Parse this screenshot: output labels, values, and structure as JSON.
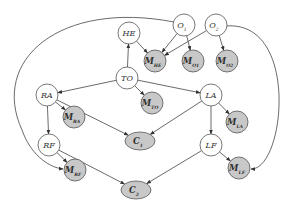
{
  "diagram": {
    "type": "bayesian-network",
    "nodes": [
      {
        "id": "HE",
        "label": "HE",
        "sub": "",
        "x": 129,
        "y": 33,
        "shape": "circle",
        "shaded": false
      },
      {
        "id": "O1",
        "label": "O",
        "sub": "1",
        "x": 184,
        "y": 25,
        "shape": "circle",
        "shaded": false
      },
      {
        "id": "O2",
        "label": "O",
        "sub": "2",
        "x": 216,
        "y": 25,
        "shape": "circle",
        "shaded": false
      },
      {
        "id": "MHE",
        "label": "M",
        "sub": "HE",
        "x": 155,
        "y": 61,
        "shape": "circle",
        "shaded": true
      },
      {
        "id": "MO1",
        "label": "M",
        "sub": "O1",
        "x": 193,
        "y": 61,
        "shape": "circle",
        "shaded": true
      },
      {
        "id": "MO2",
        "label": "M",
        "sub": "O2",
        "x": 227,
        "y": 61,
        "shape": "circle",
        "shaded": true
      },
      {
        "id": "TO",
        "label": "TO",
        "sub": "",
        "x": 127,
        "y": 78,
        "shape": "circle",
        "shaded": false
      },
      {
        "id": "RA",
        "label": "RA",
        "sub": "",
        "x": 47,
        "y": 95,
        "shape": "circle",
        "shaded": false
      },
      {
        "id": "MTO",
        "label": "M",
        "sub": "TO",
        "x": 152,
        "y": 103,
        "shape": "circle",
        "shaded": true
      },
      {
        "id": "LA",
        "label": "LA",
        "sub": "",
        "x": 211,
        "y": 95,
        "shape": "circle",
        "shaded": false
      },
      {
        "id": "MRA",
        "label": "M",
        "sub": "RA",
        "x": 74,
        "y": 117,
        "shape": "circle",
        "shaded": true
      },
      {
        "id": "MLA",
        "label": "M",
        "sub": "LA",
        "x": 237,
        "y": 122,
        "shape": "circle",
        "shaded": true
      },
      {
        "id": "C1",
        "label": "C",
        "sub": "1",
        "x": 140,
        "y": 141,
        "shape": "ellipse",
        "shaded": true
      },
      {
        "id": "RF",
        "label": "RF",
        "sub": "",
        "x": 49,
        "y": 145,
        "shape": "circle",
        "shaded": false
      },
      {
        "id": "LF",
        "label": "LF",
        "sub": "",
        "x": 211,
        "y": 145,
        "shape": "circle",
        "shaded": false
      },
      {
        "id": "MRF",
        "label": "M",
        "sub": "RF",
        "x": 75,
        "y": 170,
        "shape": "circle",
        "shaded": true
      },
      {
        "id": "MLF",
        "label": "M",
        "sub": "LF",
        "x": 239,
        "y": 168,
        "shape": "circle",
        "shaded": true
      },
      {
        "id": "C2",
        "label": "C",
        "sub": "2",
        "x": 136,
        "y": 190,
        "shape": "ellipse",
        "shaded": true
      }
    ],
    "edges": [
      {
        "from": "TO",
        "to": "HE"
      },
      {
        "from": "TO",
        "to": "RA"
      },
      {
        "from": "TO",
        "to": "LA"
      },
      {
        "from": "TO",
        "to": "MTO"
      },
      {
        "from": "HE",
        "to": "MHE"
      },
      {
        "from": "O1",
        "to": "MHE"
      },
      {
        "from": "O2",
        "to": "MHE"
      },
      {
        "from": "O1",
        "to": "MO1"
      },
      {
        "from": "O2",
        "to": "MO2"
      },
      {
        "from": "RA",
        "to": "MRA"
      },
      {
        "from": "RA",
        "to": "RF"
      },
      {
        "from": "RA",
        "to": "C1"
      },
      {
        "from": "LA",
        "to": "MLA"
      },
      {
        "from": "LA",
        "to": "LF"
      },
      {
        "from": "LA",
        "to": "C1"
      },
      {
        "from": "RF",
        "to": "MRF"
      },
      {
        "from": "RF",
        "to": "C2"
      },
      {
        "from": "LF",
        "to": "MLF"
      },
      {
        "from": "LF",
        "to": "C2"
      },
      {
        "from": "O1",
        "to": "MRF",
        "curved": true
      },
      {
        "from": "O2",
        "to": "MLF",
        "curved": true
      }
    ]
  },
  "colors": {
    "node_fill": "#ffffff",
    "shaded_fill": "#c8c8c8",
    "stroke": "#555555",
    "text": "#333333"
  }
}
